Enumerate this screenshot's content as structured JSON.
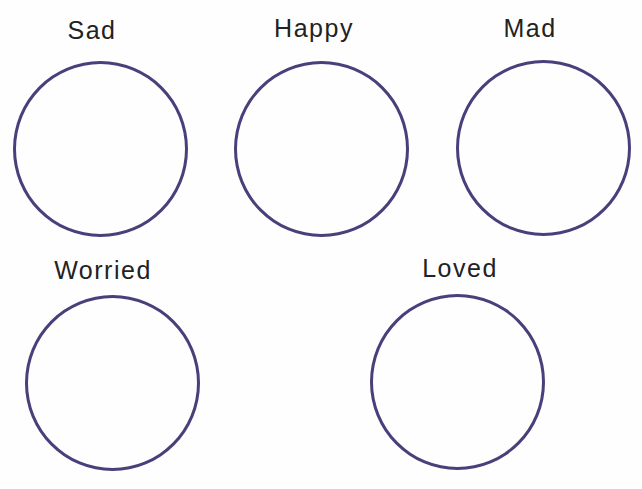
{
  "worksheet": {
    "stroke_color": "#4a3f7a",
    "items": [
      {
        "label": "Sad"
      },
      {
        "label": "Happy"
      },
      {
        "label": "Mad"
      },
      {
        "label": "Worried"
      },
      {
        "label": "Loved"
      }
    ]
  }
}
